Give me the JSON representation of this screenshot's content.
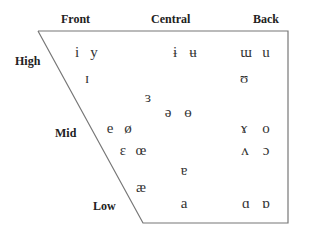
{
  "diagram": {
    "colors": {
      "line": "#777777",
      "text": "#222222",
      "vowel": "#333333"
    },
    "trapezoid": {
      "points": [
        [
          38,
          31
        ],
        [
          288,
          31
        ],
        [
          288,
          223
        ],
        [
          143,
          223
        ]
      ]
    },
    "column_labels": {
      "front": "Front",
      "central": "Central",
      "back": "Back"
    },
    "row_labels": {
      "high": "High",
      "mid": "Mid",
      "low": "Low"
    },
    "vowels": {
      "i": "i",
      "y": "y",
      "small_cap_i": "ɪ",
      "barred_i": "ɨ",
      "barred_u": "ʉ",
      "turned_m": "ɯ",
      "u": "u",
      "upsilon": "ʊ",
      "reversed_epsilon": "ɜ",
      "schwa": "ə",
      "barred_o": "ɵ",
      "e": "e",
      "o_slash": "ø",
      "ram_horns": "ɤ",
      "o": "o",
      "epsilon": "ɛ",
      "oe_ligature": "œ",
      "turned_v": "ʌ",
      "open_o": "ɔ",
      "turned_a": "ɐ",
      "ae": "æ",
      "a": "a",
      "script_a": "ɑ",
      "turned_script_a": "ɒ"
    }
  }
}
